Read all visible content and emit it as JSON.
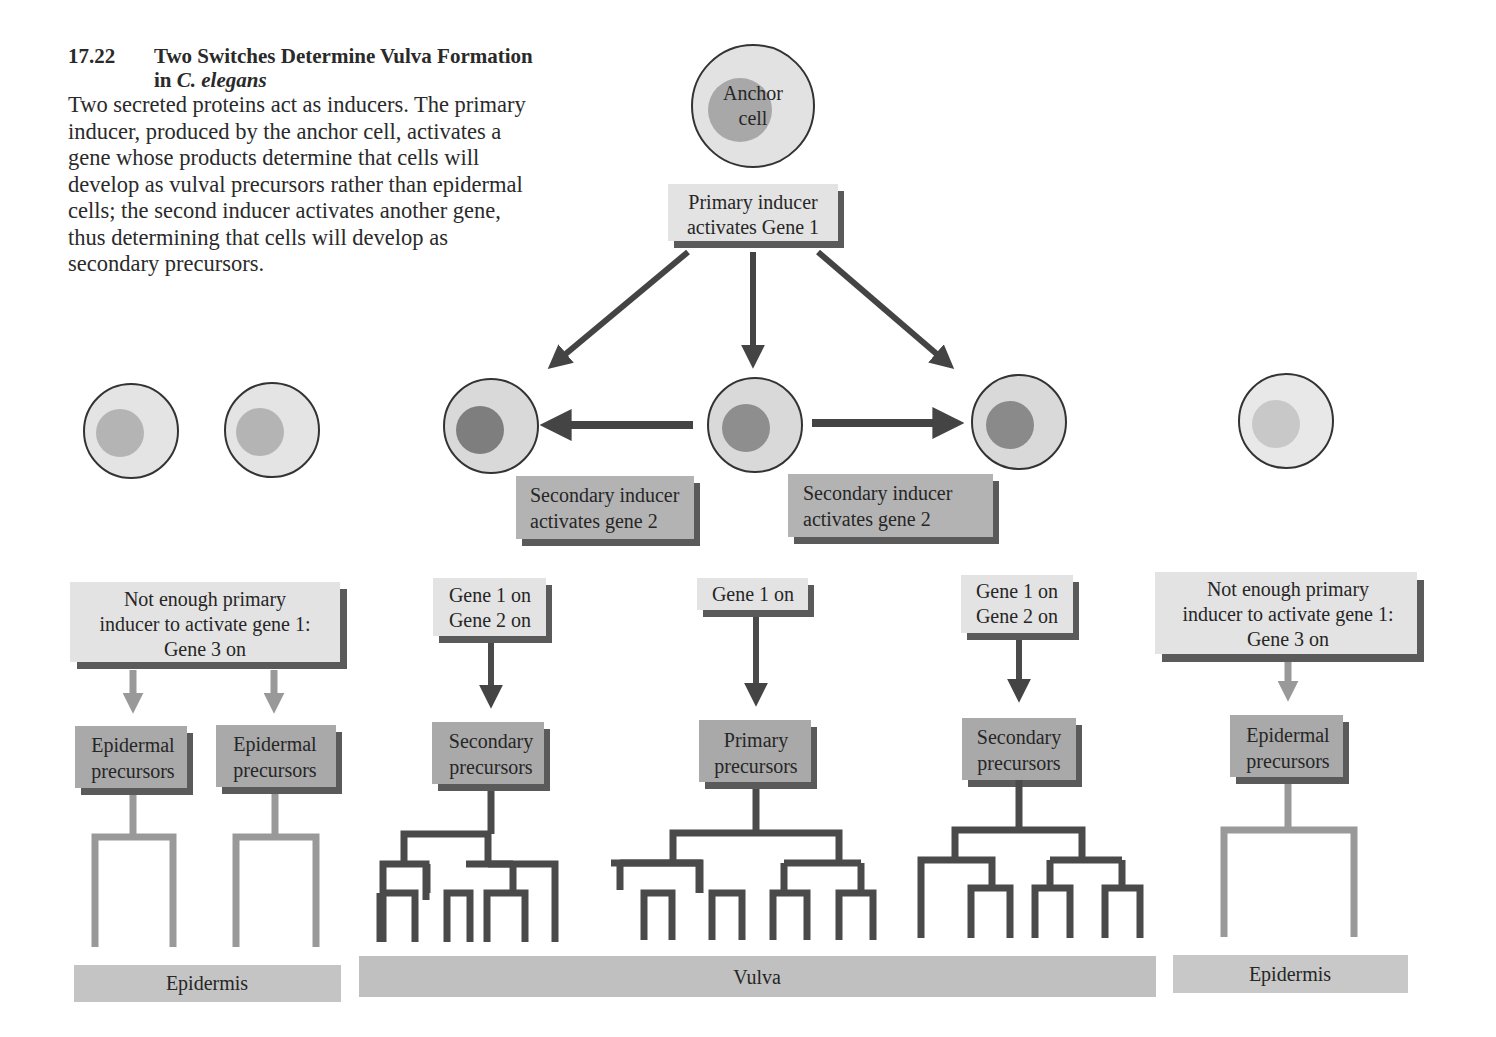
{
  "figure": {
    "number": "17.22",
    "title_part1": "Two Switches Determine Vulva Formation in ",
    "title_italic": "C. elegans",
    "body": "Two secreted proteins act as inducers. The primary inducer, produced by the anchor cell, activates a gene whose products determine that cells will develop as vulval precursors rather than epidermal cells; the second inducer activates another gene, thus determining that cells will develop as secondary precursors."
  },
  "anchor_cell": {
    "line1": "Anchor",
    "line2": "cell"
  },
  "primary_inducer": {
    "line1": "Primary inducer",
    "line2": "activates Gene 1"
  },
  "secondary_inducers": [
    {
      "line1": "Secondary inducer",
      "line2": "activates gene 2"
    },
    {
      "line1": "Secondary inducer",
      "line2": "activates gene 2"
    }
  ],
  "gene_states": [
    {
      "line1": "Not enough primary",
      "line2": "inducer to activate gene 1:",
      "line3": "Gene 3 on"
    },
    {
      "line1": "Gene 1 on",
      "line2": "Gene 2 on"
    },
    {
      "line1": "Gene 1 on"
    },
    {
      "line1": "Gene 1 on",
      "line2": "Gene 2 on"
    },
    {
      "line1": "Not enough primary",
      "line2": "inducer to activate gene 1:",
      "line3": "Gene 3 on"
    }
  ],
  "precursors": [
    {
      "line1": "Epidermal",
      "line2": "precursors"
    },
    {
      "line1": "Epidermal",
      "line2": "precursors"
    },
    {
      "line1": "Secondary",
      "line2": "precursors"
    },
    {
      "line1": "Primary",
      "line2": "precursors"
    },
    {
      "line1": "Secondary",
      "line2": "precursors"
    },
    {
      "line1": "Epidermal",
      "line2": "precursors"
    }
  ],
  "tissues": [
    {
      "label": "Epidermis"
    },
    {
      "label": "Vulva"
    },
    {
      "label": "Epidermis"
    }
  ],
  "colors": {
    "dark_arrow": "#4a4a4a",
    "light_arrow": "#9a9a9a",
    "light_box": "#e3e3e3",
    "mid_box": "#a9a9a9",
    "tissue_bar": "#c4c4c4",
    "shadow": "#5a5a5a"
  }
}
